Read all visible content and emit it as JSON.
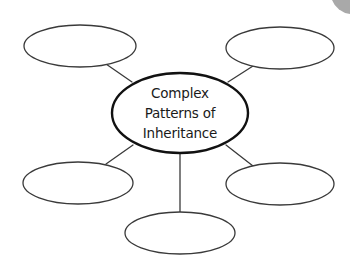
{
  "diagram": {
    "type": "concept-map",
    "center": {
      "lines": [
        "Complex",
        "Patterns of",
        "Inheritance"
      ],
      "cx": 180,
      "cy": 113,
      "rx": 68,
      "ry": 40
    },
    "nodes": [
      {
        "id": "top-left",
        "label": "",
        "cx": 80,
        "cy": 46,
        "rx": 56,
        "ry": 21
      },
      {
        "id": "top-right",
        "label": "",
        "cx": 280,
        "cy": 48,
        "rx": 54,
        "ry": 21
      },
      {
        "id": "bottom-left",
        "label": "",
        "cx": 78,
        "cy": 183,
        "rx": 55,
        "ry": 21
      },
      {
        "id": "bottom-right",
        "label": "",
        "cx": 280,
        "cy": 184,
        "rx": 54,
        "ry": 21
      },
      {
        "id": "bottom-center",
        "label": "",
        "cx": 180,
        "cy": 233,
        "rx": 55,
        "ry": 21
      }
    ],
    "connectors": [
      {
        "from": "center",
        "to": "top-left",
        "x1": 132,
        "y1": 82,
        "x2": 106,
        "y2": 64
      },
      {
        "from": "center",
        "to": "top-right",
        "x1": 228,
        "y1": 82,
        "x2": 253,
        "y2": 66
      },
      {
        "from": "center",
        "to": "bottom-left",
        "x1": 133,
        "y1": 145,
        "x2": 106,
        "y2": 164
      },
      {
        "from": "center",
        "to": "bottom-right",
        "x1": 226,
        "y1": 145,
        "x2": 253,
        "y2": 166
      },
      {
        "from": "center",
        "to": "bottom-center",
        "x1": 180,
        "y1": 154,
        "x2": 180,
        "y2": 213
      }
    ],
    "colors": {
      "background": "#ffffff",
      "stroke": "#3a3a3a",
      "center_stroke": "#111111",
      "text": "#1a1a1a",
      "corner_mark": "#8a8a8a"
    }
  }
}
